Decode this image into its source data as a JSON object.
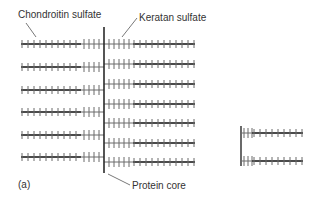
{
  "labels": {
    "chondroitin": "Chondroitin sulfate",
    "keratan": "Keratan sulfate",
    "protein_core": "Protein core",
    "panel": "(a)"
  },
  "colors": {
    "core": "#2a2a2a",
    "chain": "#4a4a4a",
    "tick": "#6a6a6a",
    "text": "#333333"
  },
  "core": {
    "x": 104,
    "y1": 27,
    "y2": 173
  },
  "left_rows": [
    44,
    67,
    90,
    112,
    135,
    157
  ],
  "right_rows": [
    44,
    64,
    84,
    104,
    123,
    143,
    162
  ],
  "fragment": {
    "x": 241,
    "y1": 126,
    "y2": 166,
    "rows": [
      133,
      161
    ]
  }
}
